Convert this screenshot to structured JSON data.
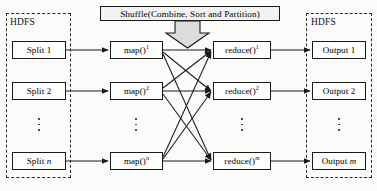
{
  "diagram": {
    "type": "flow-diagram",
    "colors": {
      "stroke": "#1a1a1a",
      "dashed_zone": "#2a2a2a",
      "box_fill": "#fdfdfc",
      "shuffle_fill": "#f2f2f1",
      "arrow_block_fill": "#dcdcdc",
      "background": "#fbfbfa"
    }
  },
  "zones": {
    "left": {
      "label": "HDFS"
    },
    "right": {
      "label": "HDFS"
    }
  },
  "shuffle": {
    "label": "Shuffle(Combine, Sort and Partition)"
  },
  "columns": {
    "splits": {
      "items": [
        {
          "text": "Split 1",
          "base": "Split",
          "index": "1",
          "italic_index": false
        },
        {
          "text": "Split 2",
          "base": "Split",
          "index": "2",
          "italic_index": false
        },
        {
          "text": "Split n",
          "base": "Split",
          "index": "n",
          "italic_index": true
        }
      ],
      "ellipsis": "⋮"
    },
    "maps": {
      "items": [
        {
          "text": "map()1",
          "base": "map()",
          "sup": "1",
          "italic_sup": false
        },
        {
          "text": "map()2",
          "base": "map()",
          "sup": "2",
          "italic_sup": false
        },
        {
          "text": "map()n",
          "base": "map()",
          "sup": "n",
          "italic_sup": true
        }
      ],
      "ellipsis": "⋮"
    },
    "reduces": {
      "items": [
        {
          "text": "reduce()1",
          "base": "reduce()",
          "sup": "1",
          "italic_sup": false
        },
        {
          "text": "reduce()2",
          "base": "reduce()",
          "sup": "2",
          "italic_sup": false
        },
        {
          "text": "reduce()m",
          "base": "reduce()",
          "sup": "m",
          "italic_sup": true
        }
      ],
      "ellipsis": "⋮"
    },
    "outputs": {
      "items": [
        {
          "text": "Output 1",
          "base": "Output",
          "index": "1",
          "italic_index": false
        },
        {
          "text": "Output 2",
          "base": "Output",
          "index": "2",
          "italic_index": false
        },
        {
          "text": "Output m",
          "base": "Output",
          "index": "m",
          "italic_index": true
        }
      ],
      "ellipsis": "⋮"
    }
  }
}
